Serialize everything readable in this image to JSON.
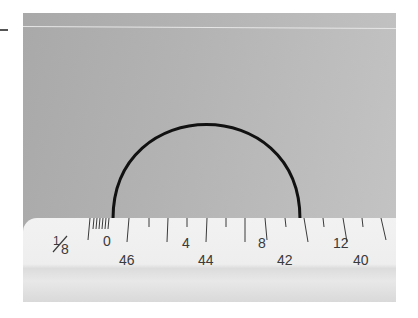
{
  "scene": {
    "description": "Photograph of a black semicircular wire resting on a white ruler against a gray background",
    "colors": {
      "background": "#b5b5b5",
      "ruler": "#efefef",
      "arc": "#111111",
      "markings": "#3a3a3a"
    }
  },
  "ruler": {
    "fraction_label": "1/8",
    "fraction_num": "1",
    "fraction_den": "8",
    "top_scale": [
      "0",
      "4",
      "8",
      "12"
    ],
    "bottom_scale": [
      "46",
      "44",
      "42",
      "40"
    ]
  }
}
